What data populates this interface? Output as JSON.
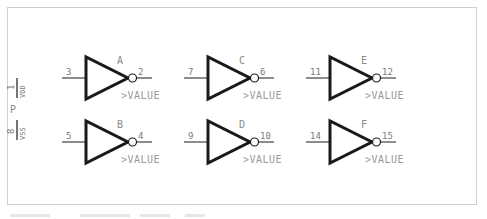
{
  "diagram": {
    "type": "schematic",
    "colors": {
      "stroke": "#1a1a1a",
      "text": "#8a8a8a",
      "frame": "#cfcfcf",
      "background": "#ffffff"
    },
    "power_pins": {
      "part_label": "P",
      "vdd": {
        "pin": "1",
        "name": "VDD"
      },
      "vss": {
        "pin": "8",
        "name": "VSS"
      }
    },
    "gates": [
      {
        "ref": "A",
        "in_pin": "3",
        "out_pin": "2",
        "value": ">VALUE"
      },
      {
        "ref": "B",
        "in_pin": "5",
        "out_pin": "4",
        "value": ">VALUE"
      },
      {
        "ref": "C",
        "in_pin": "7",
        "out_pin": "6",
        "value": ">VALUE"
      },
      {
        "ref": "D",
        "in_pin": "9",
        "out_pin": "10",
        "value": ">VALUE"
      },
      {
        "ref": "E",
        "in_pin": "11",
        "out_pin": "12",
        "value": ">VALUE"
      },
      {
        "ref": "F",
        "in_pin": "14",
        "out_pin": "15",
        "value": ">VALUE"
      }
    ]
  }
}
